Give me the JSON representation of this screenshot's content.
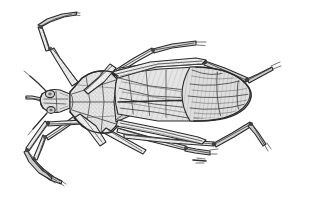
{
  "figure": {
    "kind": "scientific-line-illustration",
    "subject": "true bug (Hemiptera), dorsal view",
    "orientation": "head to the left, abdomen to the right",
    "technique": "engraved stipple and hatch line drawing",
    "background_color": "#ffffff",
    "ink_color": "#2b2b2b",
    "canvas": {
      "width": 315,
      "height": 206
    }
  },
  "anatomy": {
    "head": {
      "label": "head",
      "position": "left"
    },
    "eye": {
      "label": "compound eye",
      "position": "left-lateral"
    },
    "antenna_upper": {
      "label": "antenna",
      "position": "upper-left"
    },
    "antenna_lower": {
      "label": "antenna",
      "position": "lower-left"
    },
    "rostrum": {
      "label": "rostrum",
      "position": "anterior"
    },
    "pronotum": {
      "label": "pronotum",
      "position": "anterior-thorax"
    },
    "scutellum": {
      "label": "scutellum",
      "position": "mid-thorax"
    },
    "forewing_corium": {
      "label": "corium of hemelytron",
      "position": "mid-dorsal"
    },
    "forewing_membrane": {
      "label": "wing membrane",
      "position": "posterior"
    },
    "abdomen": {
      "label": "abdomen",
      "position": "posterior, beneath wings"
    },
    "legs": [
      {
        "label": "left foreleg",
        "direction": "upper-left"
      },
      {
        "label": "left midleg",
        "direction": "lower-left"
      },
      {
        "label": "left hindleg",
        "direction": "lower-left, long"
      },
      {
        "label": "right foreleg",
        "direction": "upper-right"
      },
      {
        "label": "right midleg",
        "direction": "lower-right"
      },
      {
        "label": "right hindleg",
        "direction": "right, long"
      }
    ]
  },
  "palette": {
    "ink": "#2b2b2b",
    "mid_ink": "#3c3c3c",
    "light_ink": "#6a6a6a",
    "stipple": "#8c8c8c",
    "wing_tint": "#d9d9d9",
    "body_tint": "#e3e3e3",
    "paper": "#ffffff"
  }
}
